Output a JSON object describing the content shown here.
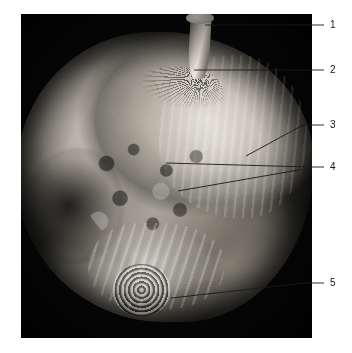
{
  "figure": {
    "type": "anatomical-specimen-photograph",
    "background_color": "#ffffff",
    "plate_color": "#060606",
    "leader_line_color": "#1a1a1a",
    "label_text_color": "#141414",
    "plate": {
      "x": 21,
      "y": 14,
      "width": 291,
      "height": 324
    }
  },
  "callouts": [
    {
      "number": "1",
      "label_x": 330,
      "label_y": 25,
      "line": [
        {
          "x": 205,
          "y": 25
        },
        {
          "x": 324,
          "y": 25
        }
      ]
    },
    {
      "number": "2",
      "label_x": 330,
      "label_y": 70,
      "line": [
        {
          "x": 194,
          "y": 70
        },
        {
          "x": 324,
          "y": 70
        }
      ]
    },
    {
      "number": "3",
      "label_x": 330,
      "label_y": 125,
      "line": [
        {
          "x": 246,
          "y": 156
        },
        {
          "x": 303,
          "y": 125
        },
        {
          "x": 324,
          "y": 125
        }
      ]
    },
    {
      "number": "4",
      "label_x": 330,
      "label_y": 167,
      "line": [
        {
          "x": 166,
          "y": 163
        },
        {
          "x": 310,
          "y": 167
        },
        {
          "x": 324,
          "y": 167
        }
      ]
    },
    {
      "number": "4b",
      "label_x": null,
      "label_y": null,
      "line": [
        {
          "x": 178,
          "y": 191
        },
        {
          "x": 310,
          "y": 168
        }
      ]
    },
    {
      "number": "5",
      "label_x": 330,
      "label_y": 283,
      "line": [
        {
          "x": 171,
          "y": 298
        },
        {
          "x": 305,
          "y": 283
        },
        {
          "x": 324,
          "y": 283
        }
      ]
    }
  ]
}
